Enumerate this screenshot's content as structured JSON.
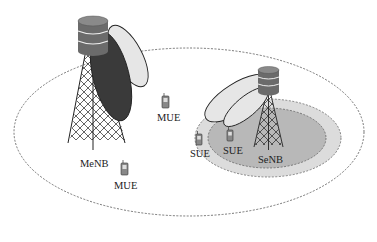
{
  "diagram": {
    "type": "heterogeneous-network",
    "macro_cell": {
      "name": "macro-cell-coverage",
      "base_station_label": "MeNB",
      "users": [
        {
          "label": "MUE",
          "x": 166,
          "y": 104
        },
        {
          "label": "MUE",
          "x": 124,
          "y": 166
        }
      ]
    },
    "small_cell": {
      "name": "small-cell-coverage",
      "base_station_label": "SeNB",
      "users": [
        {
          "label": "SUE",
          "x": 199,
          "y": 135
        },
        {
          "label": "SUE",
          "x": 230,
          "y": 130
        }
      ]
    },
    "colors": {
      "dark_beam": "#3a3a3a",
      "light_beam": "#e6e6e6",
      "outer_small_ring": "#dcdcdc",
      "inner_small_ring": "#b8b8b8",
      "server": "#6b6b6b",
      "line": "#222222"
    }
  }
}
